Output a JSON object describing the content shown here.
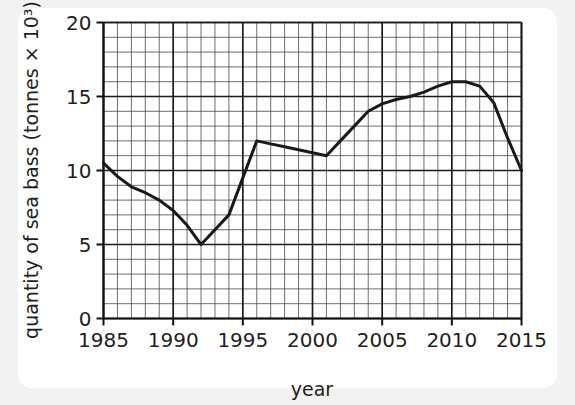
{
  "chart_data": {
    "type": "line",
    "title": "",
    "xlabel": "year",
    "ylabel": "quantity of sea bass (tonnes × 10³)",
    "xlim": [
      1985,
      2015
    ],
    "ylim": [
      0,
      20
    ],
    "x_major_ticks": [
      1985,
      1990,
      1995,
      2000,
      2005,
      2010,
      2015
    ],
    "x_tick_labels": [
      "1985",
      "1990",
      "1995",
      "2000",
      "2005",
      "2010",
      "2015"
    ],
    "y_major_ticks": [
      0,
      5,
      10,
      15,
      20
    ],
    "y_tick_labels": [
      "0",
      "5",
      "10",
      "15",
      "20"
    ],
    "x_minor_step": 1,
    "y_minor_step": 1,
    "grid": true,
    "grid_minor": true,
    "legend": false,
    "legend_position": "none",
    "line_color": "#1a1a1a",
    "x": [
      1985,
      1986,
      1987,
      1988,
      1989,
      1990,
      1991,
      1992,
      1993,
      1994,
      1995,
      1996,
      1997,
      1998,
      1999,
      2000,
      2001,
      2002,
      2003,
      2004,
      2005,
      2006,
      2007,
      2008,
      2009,
      2010,
      2011,
      2012,
      2013,
      2014,
      2015
    ],
    "values": [
      10.5,
      9.6,
      8.9,
      8.5,
      8.0,
      7.3,
      6.3,
      5.0,
      6.0,
      7.0,
      9.5,
      12.0,
      11.8,
      11.6,
      11.4,
      11.2,
      11.0,
      12.0,
      13.0,
      14.0,
      14.5,
      14.8,
      15.0,
      15.3,
      15.7,
      16.0,
      16.0,
      15.7,
      14.6,
      12.2,
      10.0
    ]
  },
  "colors": {
    "page_background": "#f2f2f2",
    "card_background": "#ffffff",
    "ink": "#231f20",
    "grid_major": "#1a1a1a",
    "grid_minor": "#4a4a4a"
  }
}
